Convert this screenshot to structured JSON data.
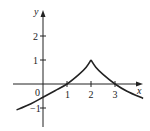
{
  "chart_data": {
    "type": "line",
    "title": "",
    "xlabel": "x",
    "ylabel": "y",
    "xlim": [
      -1.6,
      4.2
    ],
    "ylim": [
      -1.9,
      3.4
    ],
    "grid": false,
    "legend": null,
    "x_ticks": [
      1,
      2,
      3
    ],
    "x_tick_labels": [
      "1",
      "2",
      "3"
    ],
    "y_ticks": [
      2,
      1,
      -1
    ],
    "y_tick_labels": [
      "2",
      "1",
      "-1"
    ],
    "origin_label": "0",
    "series": [
      {
        "name": "f(x)",
        "description": "continuous curve with a cusp at (2, 1); increasing on left, decreasing on right",
        "points": [
          [
            -1.1,
            -1.08
          ],
          [
            -0.5,
            -0.82
          ],
          [
            0,
            -0.55
          ],
          [
            0.5,
            -0.28
          ],
          [
            1,
            0
          ],
          [
            1.5,
            0.4
          ],
          [
            1.8,
            0.7
          ],
          [
            2,
            1
          ],
          [
            2.2,
            0.7
          ],
          [
            2.5,
            0.4
          ],
          [
            3,
            0
          ],
          [
            3.5,
            -0.3
          ],
          [
            4.17,
            -0.6
          ]
        ]
      }
    ],
    "key_points": {
      "cusp": [
        2,
        1
      ],
      "x_intercepts": [
        1,
        3
      ],
      "y_intercept": -0.55
    }
  },
  "labels": {
    "x_axis": "x",
    "y_axis": "y",
    "origin": "0",
    "x1": "1",
    "x2": "2",
    "x3": "3",
    "y2": "2",
    "y1": "1",
    "yneg1": "−1"
  }
}
